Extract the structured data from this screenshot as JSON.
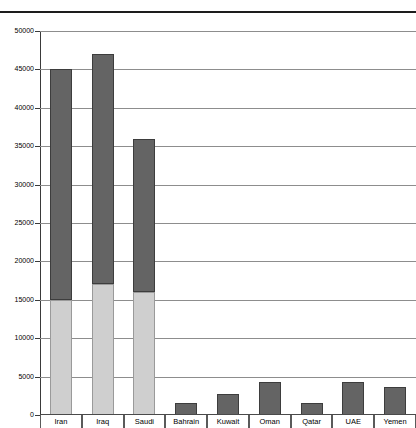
{
  "chart_data": {
    "type": "bar",
    "title": "",
    "subtitle": "",
    "xlabel": "",
    "ylabel": "",
    "stacked": true,
    "grid": true,
    "legend_position": "none",
    "ylim": [
      0,
      50000
    ],
    "ytick_step": 5000,
    "ytick_labels": [
      "50000",
      "45000",
      "40000",
      "35000",
      "30000",
      "25000",
      "20000",
      "15000",
      "10000",
      "5000",
      "0"
    ],
    "ytick_values": [
      50000,
      45000,
      40000,
      35000,
      30000,
      25000,
      20000,
      15000,
      10000,
      5000,
      0
    ],
    "categories": [
      "Iran",
      "Iraq",
      "Saudi",
      "Bahrain",
      "Kuwait",
      "Oman",
      "Qatar",
      "UAE",
      "Yemen"
    ],
    "series": [
      {
        "name": "lower-segment",
        "color": "#cfcfcf",
        "values": [
          15000,
          17000,
          16000,
          0,
          0,
          0,
          0,
          0,
          0
        ]
      },
      {
        "name": "upper-segment",
        "color": "#646464",
        "values": [
          30000,
          30000,
          20000,
          1500,
          2700,
          4300,
          1600,
          4300,
          3700
        ]
      }
    ],
    "totals": [
      45000,
      47000,
      36000,
      1500,
      2700,
      4300,
      1600,
      4300,
      3700
    ]
  },
  "colors": {
    "upper_fill": "#646464",
    "upper_stroke": "#3d3d3d",
    "lower_fill": "#cfcfcf",
    "lower_stroke": "#9a9a9a",
    "gridline": "#8d8d8d",
    "axis": "#3a3a3a",
    "top_rule": "#1d1d1d",
    "background": "#ffffff"
  }
}
